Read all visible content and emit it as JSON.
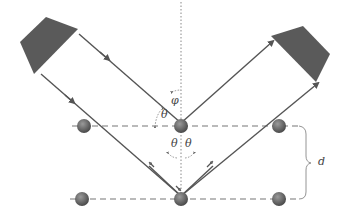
{
  "diagram": {
    "labels": {
      "phi": "φ",
      "theta_upper": "θ",
      "theta_lower_left": "θ",
      "theta_lower_right": "θ",
      "spacing": "d"
    },
    "colors": {
      "ray": "#555555",
      "source": "#555555",
      "atom": "#666666",
      "plane": "#777777",
      "normal": "#888888"
    },
    "planes": [
      {
        "name": "upper-plane",
        "atoms": 3
      },
      {
        "name": "lower-plane",
        "atoms": 3
      }
    ]
  }
}
